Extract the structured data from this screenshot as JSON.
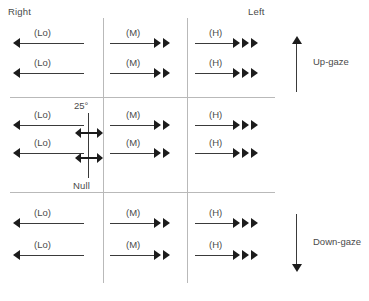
{
  "figure": {
    "header_labels": {
      "right": "Right",
      "left": "Left"
    },
    "gaze_markers": [
      {
        "id": "up-gaze",
        "label": "Up-gaze",
        "direction": "up"
      },
      {
        "id": "down-gaze",
        "label": "Down-gaze",
        "direction": "down"
      }
    ],
    "null_zone": {
      "degree_label": "25°",
      "null_label": "Null"
    },
    "intensity_labels": {
      "low": "(Lo)",
      "medium": "(M)",
      "high": "(H)"
    },
    "grid": {
      "columns": [
        "Right",
        "Center",
        "Left"
      ],
      "rows": [
        "Up-gaze",
        "Primary",
        "Down-gaze"
      ]
    },
    "cells": [
      {
        "row": "Up-gaze",
        "column": "Right",
        "arrows": [
          {
            "label": "(Lo)",
            "direction": "left",
            "heads": 1
          },
          {
            "label": "(Lo)",
            "direction": "left",
            "heads": 1
          }
        ]
      },
      {
        "row": "Up-gaze",
        "column": "Center",
        "arrows": [
          {
            "label": "(M)",
            "direction": "right",
            "heads": 2
          },
          {
            "label": "(M)",
            "direction": "right",
            "heads": 2
          }
        ]
      },
      {
        "row": "Up-gaze",
        "column": "Left",
        "arrows": [
          {
            "label": "(H)",
            "direction": "right",
            "heads": 3
          },
          {
            "label": "(H)",
            "direction": "right",
            "heads": 3
          }
        ]
      },
      {
        "row": "Primary",
        "column": "Right",
        "arrows": [
          {
            "label": "(Lo)",
            "direction": "left",
            "heads": 1
          },
          {
            "label": "(Lo)",
            "direction": "left",
            "heads": 1
          }
        ]
      },
      {
        "row": "Primary",
        "column": "Center",
        "arrows": [
          {
            "label": "(M)",
            "direction": "right",
            "heads": 2
          },
          {
            "label": "(M)",
            "direction": "right",
            "heads": 2
          }
        ]
      },
      {
        "row": "Primary",
        "column": "Left",
        "arrows": [
          {
            "label": "(H)",
            "direction": "right",
            "heads": 3
          },
          {
            "label": "(H)",
            "direction": "right",
            "heads": 3
          }
        ]
      },
      {
        "row": "Down-gaze",
        "column": "Right",
        "arrows": [
          {
            "label": "(Lo)",
            "direction": "left",
            "heads": 1
          },
          {
            "label": "(Lo)",
            "direction": "left",
            "heads": 1
          }
        ]
      },
      {
        "row": "Down-gaze",
        "column": "Center",
        "arrows": [
          {
            "label": "(M)",
            "direction": "right",
            "heads": 2
          },
          {
            "label": "(M)",
            "direction": "right",
            "heads": 2
          }
        ]
      },
      {
        "row": "Down-gaze",
        "column": "Left",
        "arrows": [
          {
            "label": "(H)",
            "direction": "right",
            "heads": 3
          },
          {
            "label": "(H)",
            "direction": "right",
            "heads": 3
          }
        ]
      }
    ],
    "colors": {
      "background": "#ffffff",
      "grid_line": "#b9b9b9",
      "arrow": "#1c1c1c",
      "text": "#4a4a4a"
    }
  }
}
